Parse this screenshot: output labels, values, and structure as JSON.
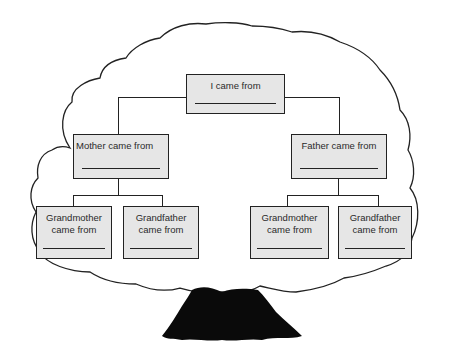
{
  "diagram": {
    "type": "family-tree-worksheet",
    "root": {
      "label": "I came from",
      "blank": true
    },
    "parents": [
      {
        "label": "Mother came from",
        "blank": true
      },
      {
        "label": "Father came from",
        "blank": true
      }
    ],
    "grandparents": [
      {
        "label_line1": "Grandmother",
        "label_line2": "came from",
        "blank": true,
        "side": "mother"
      },
      {
        "label_line1": "Grandfather",
        "label_line2": "came from",
        "blank": true,
        "side": "mother"
      },
      {
        "label_line1": "Grandmother",
        "label_line2": "came from",
        "blank": true,
        "side": "father"
      },
      {
        "label_line1": "Grandfather",
        "label_line2": "came from",
        "blank": true,
        "side": "father"
      }
    ],
    "colors": {
      "box_fill": "#e6e6e6",
      "line": "#222222",
      "trunk": "#0a0a0a",
      "background": "#ffffff"
    }
  }
}
